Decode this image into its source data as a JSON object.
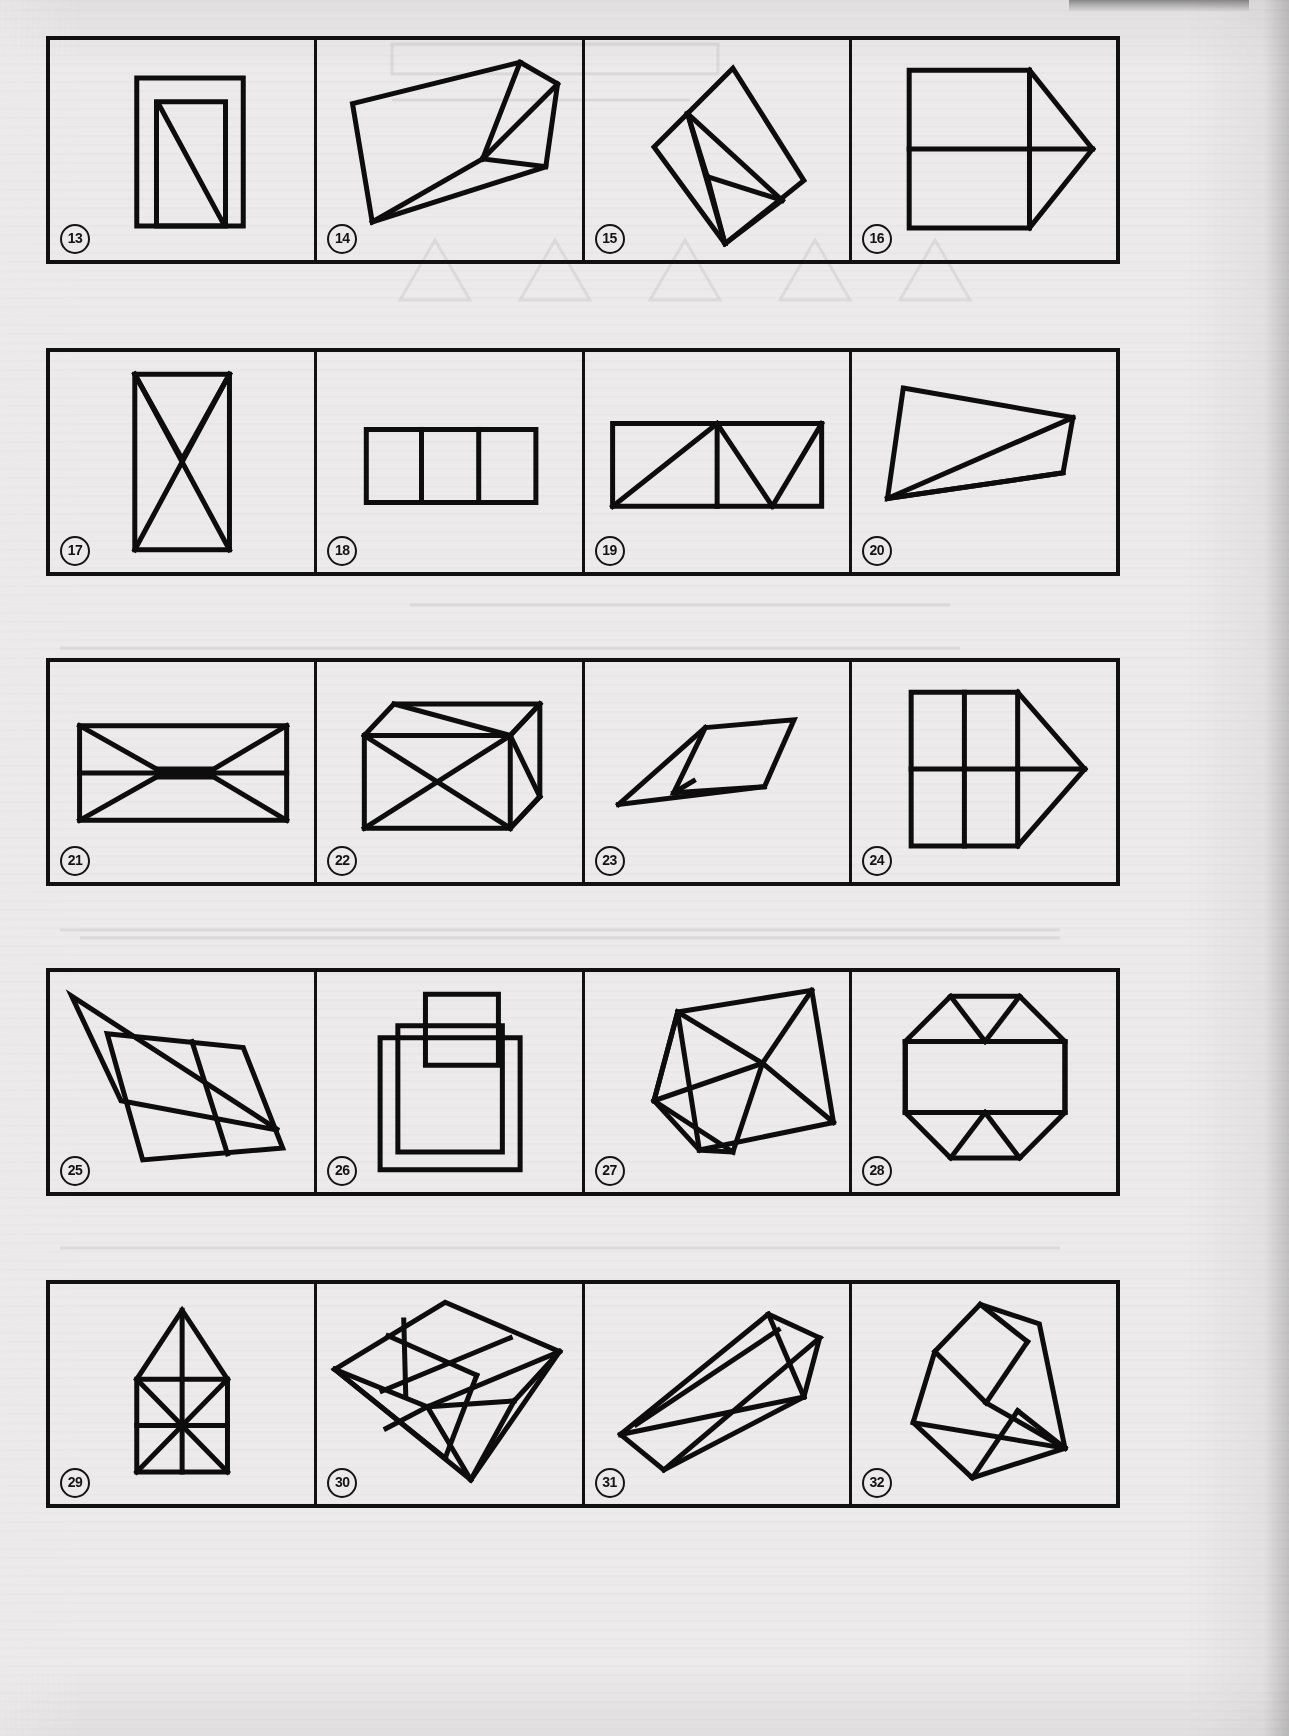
{
  "page": {
    "kind": "test-figure-plate",
    "background_color": "#eceaea",
    "ink_color": "#0d0d0d",
    "width": 1289,
    "height": 1736,
    "columns": 4,
    "rows": 5
  },
  "rows": [
    {
      "index": 0,
      "box": {
        "x": 46,
        "y": 36,
        "w": 1074,
        "h": 228
      },
      "cells": [
        {
          "label": "13",
          "name": "figure-13",
          "description": "upright rectangle outline with a narrower inner rectangle and a diagonal from inner top-left to inner bottom-right",
          "viewBox": "0 0 268 222",
          "shapes": [
            {
              "type": "polygon",
              "points": "88,38 196,38 196,188 88,188"
            },
            {
              "type": "polygon",
              "points": "108,62 178,62 178,188 108,188"
            },
            {
              "type": "line",
              "points": "110,64 176,186"
            }
          ]
        },
        {
          "label": "14",
          "name": "figure-14",
          "description": "tilted quadrilateral with internal fan of lines meeting at a right-centre vertex",
          "viewBox": "0 0 268 222",
          "shapes": [
            {
              "type": "polygon",
              "points": "36,64 206,22 244,44 232,128 56,184"
            },
            {
              "type": "line",
              "points": "206,22 168,120"
            },
            {
              "type": "line",
              "points": "168,120 244,44"
            },
            {
              "type": "line",
              "points": "168,120 232,128"
            },
            {
              "type": "line",
              "points": "168,120 56,184"
            }
          ]
        },
        {
          "label": "15",
          "name": "figure-15",
          "description": "rotated rectangle containing a narrow fan of triangles radiating from its upper-left vertex",
          "viewBox": "0 0 268 222",
          "shapes": [
            {
              "type": "polygon",
              "points": "70,108 150,28 222,142 142,206"
            },
            {
              "type": "line",
              "points": "104,74 200,162"
            },
            {
              "type": "line",
              "points": "104,74 124,138"
            },
            {
              "type": "line",
              "points": "104,74 142,206"
            },
            {
              "type": "line",
              "points": "124,138 200,162"
            },
            {
              "type": "line",
              "points": "124,138 142,206"
            },
            {
              "type": "line",
              "points": "142,206 200,162"
            }
          ]
        },
        {
          "label": "16",
          "name": "figure-16",
          "description": "square divided into four quadrants with a right triangle appended on the right side",
          "viewBox": "0 0 268 222",
          "shapes": [
            {
              "type": "polygon",
              "points": "58,30 180,30 180,190 58,190"
            },
            {
              "type": "line",
              "points": "58,110 180,110"
            },
            {
              "type": "line",
              "points": "180,30 244,110"
            },
            {
              "type": "line",
              "points": "244,110 180,190"
            },
            {
              "type": "line",
              "points": "180,110 244,110"
            }
          ]
        }
      ]
    },
    {
      "index": 1,
      "box": {
        "x": 46,
        "y": 348,
        "w": 1074,
        "h": 228
      },
      "cells": [
        {
          "label": "17",
          "name": "figure-17",
          "description": "tall rectangle with a large X plus a V hanging from the top corners",
          "viewBox": "0 0 268 222",
          "shapes": [
            {
              "type": "polygon",
              "points": "86,22 182,22 182,200 86,200"
            },
            {
              "type": "line",
              "points": "86,22 182,200"
            },
            {
              "type": "line",
              "points": "182,22 86,200"
            },
            {
              "type": "line",
              "points": "86,22 134,108"
            },
            {
              "type": "line",
              "points": "182,22 134,108"
            }
          ]
        },
        {
          "label": "18",
          "name": "figure-18",
          "description": "wide rectangle divided by two vertical lines into three equal square cells",
          "viewBox": "0 0 268 222",
          "shapes": [
            {
              "type": "polygon",
              "points": "50,78 222,78 222,152 50,152"
            },
            {
              "type": "line",
              "points": "106,78 106,152"
            },
            {
              "type": "line",
              "points": "164,78 164,152"
            }
          ]
        },
        {
          "label": "19",
          "name": "figure-19",
          "description": "wide rectangle crossed by zig-zag diagonals forming a row of triangles, with a vertical midline on the left half",
          "viewBox": "0 0 268 222",
          "shapes": [
            {
              "type": "polygon",
              "points": "28,72 240,72 240,156 28,156"
            },
            {
              "type": "line",
              "points": "28,156 134,72"
            },
            {
              "type": "line",
              "points": "134,72 134,156"
            },
            {
              "type": "line",
              "points": "134,72 190,156"
            },
            {
              "type": "line",
              "points": "190,156 240,72"
            }
          ]
        },
        {
          "label": "20",
          "name": "figure-20",
          "description": "tilted quadrilateral with two long thin slivers cut off its lower-right corner",
          "viewBox": "0 0 268 222",
          "shapes": [
            {
              "type": "polygon",
              "points": "52,36 224,66 214,122 36,148"
            },
            {
              "type": "line",
              "points": "36,148 224,66"
            },
            {
              "type": "line",
              "points": "36,148 214,122"
            }
          ]
        }
      ]
    },
    {
      "index": 2,
      "box": {
        "x": 46,
        "y": 658,
        "w": 1074,
        "h": 228
      },
      "cells": [
        {
          "label": "21",
          "name": "figure-21",
          "description": "wide rectangle with mirrored arrow / bowtie shapes meeting at the horizontal midline",
          "viewBox": "0 0 268 222",
          "shapes": [
            {
              "type": "polygon",
              "points": "30,64 240,64 240,160 30,160"
            },
            {
              "type": "line",
              "points": "30,112 240,112"
            },
            {
              "type": "line",
              "points": "30,64 108,108"
            },
            {
              "type": "line",
              "points": "30,160 108,116"
            },
            {
              "type": "line",
              "points": "240,64 166,108"
            },
            {
              "type": "line",
              "points": "240,160 166,116"
            },
            {
              "type": "line",
              "points": "108,108 166,108"
            },
            {
              "type": "line",
              "points": "108,116 166,116"
            }
          ]
        },
        {
          "label": "22",
          "name": "figure-22",
          "description": "cube drawn in oblique projection with an X on the front face and diagonals on the top face",
          "viewBox": "0 0 268 222",
          "shapes": [
            {
              "type": "polygon",
              "points": "48,74 196,74 196,168 48,168"
            },
            {
              "type": "line",
              "points": "48,74 196,168"
            },
            {
              "type": "line",
              "points": "196,74 48,168"
            },
            {
              "type": "polyline",
              "points": "48,74 78,42 226,42 226,136 196,168"
            },
            {
              "type": "line",
              "points": "196,74 226,42"
            },
            {
              "type": "line",
              "points": "196,74 226,136"
            },
            {
              "type": "line",
              "points": "78,42 196,74"
            },
            {
              "type": "line",
              "points": "226,42 196,74"
            },
            {
              "type": "line",
              "points": "196,168 226,136"
            }
          ]
        },
        {
          "label": "23",
          "name": "figure-23",
          "description": "flat parallelogram with a long thin dart-shaped sliver extending to the lower left",
          "viewBox": "0 0 268 222",
          "shapes": [
            {
              "type": "polygon",
              "points": "122,66 212,58 182,126 90,132"
            },
            {
              "type": "line",
              "points": "122,66 34,144"
            },
            {
              "type": "line",
              "points": "34,144 182,126"
            },
            {
              "type": "line",
              "points": "90,132 110,120"
            }
          ]
        },
        {
          "label": "24",
          "name": "figure-24",
          "description": "square split into four quadrants with a triangular arrowhead pointing right",
          "viewBox": "0 0 268 222",
          "shapes": [
            {
              "type": "polygon",
              "points": "60,30 168,30 168,186 60,186"
            },
            {
              "type": "line",
              "points": "60,108 168,108"
            },
            {
              "type": "line",
              "points": "114,30 114,186"
            },
            {
              "type": "line",
              "points": "168,30 236,108"
            },
            {
              "type": "line",
              "points": "236,108 168,186"
            },
            {
              "type": "line",
              "points": "168,108 236,108"
            }
          ]
        }
      ]
    },
    {
      "index": 3,
      "box": {
        "x": 46,
        "y": 968,
        "w": 1074,
        "h": 228
      },
      "cells": [
        {
          "label": "25",
          "name": "figure-25",
          "description": "long thin wedge overlapping a large leaning parallelogram",
          "viewBox": "0 0 268 222",
          "shapes": [
            {
              "type": "polygon",
              "points": "22,24 232,160 72,130"
            },
            {
              "type": "polygon",
              "points": "58,62 196,76 236,178 94,190"
            },
            {
              "type": "line",
              "points": "144,70 180,184"
            }
          ]
        },
        {
          "label": "26",
          "name": "figure-26",
          "description": "tall vertical rectangle overlapped by a smaller rectangle at the top and a wider rectangle behind",
          "viewBox": "0 0 268 222",
          "shapes": [
            {
              "type": "polygon",
              "points": "110,22 184,22 184,94 110,94"
            },
            {
              "type": "polygon",
              "points": "82,54 188,54 188,182 82,182"
            },
            {
              "type": "polygon",
              "points": "64,66 206,66 206,200 64,200"
            }
          ]
        },
        {
          "label": "27",
          "name": "figure-27",
          "description": "large tilted square containing an inscribed pentagon with radiating chords",
          "viewBox": "0 0 268 222",
          "shapes": [
            {
              "type": "polygon",
              "points": "94,40 230,18 252,152 116,180"
            },
            {
              "type": "line",
              "points": "94,40 70,130"
            },
            {
              "type": "line",
              "points": "70,130 116,180"
            },
            {
              "type": "polygon",
              "points": "94,40 180,92 150,182 70,130"
            },
            {
              "type": "line",
              "points": "180,92 252,152"
            },
            {
              "type": "line",
              "points": "180,92 230,18"
            },
            {
              "type": "line",
              "points": "150,182 116,180"
            },
            {
              "type": "line",
              "points": "70,130 180,92"
            }
          ]
        },
        {
          "label": "28",
          "name": "figure-28",
          "description": "regular octagon with a central rectangle and triangles filling the top and bottom",
          "viewBox": "0 0 268 222",
          "shapes": [
            {
              "type": "polygon",
              "points": "100,24 170,24 216,70 216,142 170,188 100,188 54,142 54,70"
            },
            {
              "type": "line",
              "points": "54,70 216,70"
            },
            {
              "type": "line",
              "points": "54,142 216,142"
            },
            {
              "type": "line",
              "points": "100,24 135,70"
            },
            {
              "type": "line",
              "points": "170,24 135,70"
            },
            {
              "type": "line",
              "points": "100,188 135,142"
            },
            {
              "type": "line",
              "points": "170,188 135,142"
            },
            {
              "type": "line",
              "points": "54,70 54,142"
            },
            {
              "type": "line",
              "points": "216,70 216,142"
            }
          ]
        }
      ]
    },
    {
      "index": 4,
      "box": {
        "x": 46,
        "y": 1280,
        "w": 1074,
        "h": 228
      },
      "cells": [
        {
          "label": "29",
          "name": "figure-29",
          "description": "house shape: square with an X and a cross inside, topped by a triangular roof with a vertical apex line",
          "viewBox": "0 0 268 222",
          "shapes": [
            {
              "type": "polygon",
              "points": "88,96 180,96 180,190 88,190"
            },
            {
              "type": "polyline",
              "points": "88,96 134,26 180,96"
            },
            {
              "type": "line",
              "points": "134,26 134,190"
            },
            {
              "type": "line",
              "points": "88,96 180,190"
            },
            {
              "type": "line",
              "points": "180,96 88,190"
            },
            {
              "type": "line",
              "points": "88,143 180,143"
            }
          ]
        },
        {
          "label": "30",
          "name": "figure-30",
          "description": "tilted cube in oblique projection, its faces subdivided into rectangles and triangles",
          "viewBox": "0 0 268 222",
          "shapes": [
            {
              "type": "polygon",
              "points": "18,86 130,18 246,68 156,198"
            },
            {
              "type": "line",
              "points": "18,86 112,124"
            },
            {
              "type": "line",
              "points": "112,124 246,68"
            },
            {
              "type": "line",
              "points": "112,124 156,198"
            },
            {
              "type": "line",
              "points": "72,52 162,92"
            },
            {
              "type": "line",
              "points": "162,92 130,176"
            },
            {
              "type": "line",
              "points": "88,36 90,112"
            },
            {
              "type": "line",
              "points": "66,108 196,54"
            },
            {
              "type": "line",
              "points": "18,86 130,176"
            },
            {
              "type": "line",
              "points": "70,146 112,124"
            },
            {
              "type": "line",
              "points": "200,118 246,68"
            },
            {
              "type": "line",
              "points": "156,198 200,118"
            },
            {
              "type": "line",
              "points": "112,124 200,118"
            }
          ]
        },
        {
          "label": "31",
          "name": "figure-31",
          "description": "long slanted open box / prism drawn with parallel edges and a diagonal brace",
          "viewBox": "0 0 268 222",
          "shapes": [
            {
              "type": "polyline",
              "points": "36,152 186,30 238,54 80,188 36,152"
            },
            {
              "type": "line",
              "points": "36,152 222,114"
            },
            {
              "type": "line",
              "points": "222,114 238,54"
            },
            {
              "type": "line",
              "points": "80,188 222,114"
            },
            {
              "type": "line",
              "points": "186,30 222,114"
            },
            {
              "type": "line",
              "points": "52,142 196,46"
            }
          ]
        },
        {
          "label": "32",
          "name": "figure-32",
          "description": "irregular polygon with a V notch at the top and fan of lines to the lower-right corner",
          "viewBox": "0 0 268 222",
          "shapes": [
            {
              "type": "polygon",
              "points": "84,68 130,20 190,40 216,166 122,196 62,140"
            },
            {
              "type": "line",
              "points": "84,68 136,120"
            },
            {
              "type": "line",
              "points": "136,120 178,58"
            },
            {
              "type": "line",
              "points": "62,140 216,166"
            },
            {
              "type": "line",
              "points": "136,120 216,166"
            },
            {
              "type": "line",
              "points": "122,196 168,128"
            },
            {
              "type": "line",
              "points": "168,128 216,166"
            },
            {
              "type": "line",
              "points": "130,20 178,58"
            }
          ]
        }
      ]
    }
  ],
  "bleed_through": {
    "description": "faint mirror-image text and figures showing through from the reverse side of the page",
    "marks": [
      {
        "x": 390,
        "y": 48,
        "w": 330,
        "h": 26
      },
      {
        "x": 390,
        "y": 96,
        "w": 300,
        "h": 18
      },
      {
        "x": 380,
        "y": 290,
        "w": 420,
        "h": 60
      },
      {
        "x": 410,
        "y": 600,
        "w": 540,
        "h": 20
      },
      {
        "x": 60,
        "y": 640,
        "w": 900,
        "h": 16
      },
      {
        "x": 80,
        "y": 930,
        "w": 980,
        "h": 18
      },
      {
        "x": 60,
        "y": 1240,
        "w": 1000,
        "h": 16
      }
    ]
  }
}
